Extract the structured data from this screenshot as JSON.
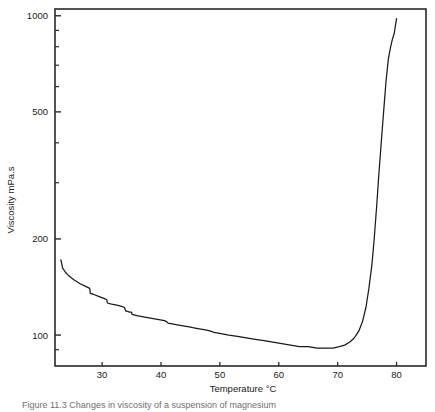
{
  "figure": {
    "caption": "Figure 11.3   Changes in viscosity of a suspension of magnesium"
  },
  "chart_data": {
    "type": "line",
    "title": "",
    "xlabel": "Temperature °C",
    "ylabel": "Viscosity mPa.s",
    "xlim": [
      22,
      85
    ],
    "ylim": [
      80,
      1050
    ],
    "yscale": "log",
    "xscale": "linear",
    "grid": false,
    "legend": null,
    "xticks": [
      30,
      40,
      50,
      60,
      70,
      80
    ],
    "xtick_labels": [
      "30",
      "40",
      "50",
      "60",
      "70",
      "80"
    ],
    "yticks": [
      100,
      200,
      500,
      1000
    ],
    "ytick_labels": [
      "100",
      "200",
      "500",
      "1000"
    ],
    "yminor_ticks": [
      90,
      300,
      400,
      600,
      700,
      800,
      900
    ],
    "series": [
      {
        "name": "Viscosity vs Temperature",
        "color": "#1a1a1a",
        "x": [
          23.0,
          23.3,
          23.8,
          24.4,
          25.2,
          26.2,
          27.2,
          27.9,
          28.0,
          28.6,
          29.5,
          30.4,
          30.8,
          30.9,
          31.6,
          32.5,
          33.3,
          33.8,
          34.0,
          34.7,
          35.0,
          35.1,
          35.9,
          37.0,
          38.2,
          39.4,
          40.6,
          41.0,
          41.2,
          42.3,
          43.5,
          44.8,
          46.0,
          47.3,
          48.3,
          49.0,
          50.2,
          51.5,
          53.0,
          54.5,
          56.0,
          57.5,
          59.0,
          60.5,
          62.0,
          63.5,
          65.0,
          66.5,
          68.0,
          69.2,
          70.3,
          71.2,
          72.0,
          72.6,
          73.0,
          73.6,
          74.2,
          74.8,
          75.3,
          75.8,
          76.2,
          76.6,
          77.0,
          77.4,
          77.8,
          78.2,
          78.6,
          79.0,
          79.3,
          79.6,
          79.8,
          80.0
        ],
        "y": [
          172,
          162,
          157,
          153,
          149,
          145,
          142,
          140,
          135,
          134,
          132,
          130,
          129,
          126,
          125,
          124,
          123,
          122,
          119,
          118,
          118,
          116,
          115,
          114,
          113,
          112,
          111,
          110,
          109,
          108,
          107,
          106,
          105,
          104,
          103,
          102,
          101,
          100,
          99,
          98,
          97,
          96,
          95,
          94,
          93,
          92,
          92,
          91,
          91,
          91,
          92,
          93,
          95,
          97,
          99,
          103,
          110,
          122,
          140,
          165,
          200,
          250,
          320,
          400,
          500,
          620,
          730,
          800,
          845,
          880,
          930,
          980
        ]
      }
    ]
  }
}
